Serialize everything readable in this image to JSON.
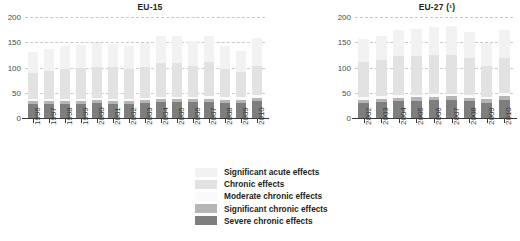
{
  "chart_data": [
    {
      "type": "bar",
      "title": "EU-15",
      "xlabel": "",
      "ylabel": "",
      "ylim": [
        0,
        200
      ],
      "yticks": [
        0,
        50,
        100,
        150,
        200
      ],
      "grid": true,
      "stacked": true,
      "legend_position": "bottom-center",
      "categories": [
        "1996",
        "1997",
        "1998",
        "1999",
        "2000",
        "2001",
        "2002",
        "2003",
        "2004",
        "2005",
        "2006",
        "2007",
        "2008",
        "2009",
        "2010"
      ],
      "series": [
        {
          "name": "Severe chronic effects",
          "values": [
            27,
            27,
            27,
            28,
            29,
            28,
            28,
            30,
            31,
            31,
            31,
            32,
            30,
            30,
            33
          ]
        },
        {
          "name": "Significant chronic effects",
          "values": [
            6,
            6,
            7,
            6,
            6,
            6,
            6,
            6,
            6,
            6,
            6,
            6,
            6,
            6,
            7
          ]
        },
        {
          "name": "Moderate chronic effects",
          "values": [
            4,
            4,
            4,
            4,
            4,
            4,
            4,
            4,
            5,
            5,
            5,
            5,
            5,
            5,
            5
          ]
        },
        {
          "name": "Chronic effects",
          "values": [
            53,
            57,
            60,
            62,
            63,
            63,
            60,
            62,
            67,
            67,
            62,
            67,
            56,
            50,
            59
          ]
        },
        {
          "name": "Significant acute effects",
          "values": [
            40,
            42,
            44,
            45,
            46,
            46,
            44,
            46,
            53,
            54,
            48,
            53,
            45,
            41,
            54
          ]
        }
      ]
    },
    {
      "type": "bar",
      "title": "EU-27 (¹)",
      "xlabel": "",
      "ylabel": "",
      "ylim": [
        0,
        200
      ],
      "yticks": [
        0,
        50,
        100,
        150,
        200
      ],
      "grid": true,
      "stacked": true,
      "legend_position": "bottom-center",
      "categories": [
        "2002",
        "2003",
        "2004",
        "2005",
        "2006",
        "2007",
        "2008",
        "2009",
        "2010"
      ],
      "series": [
        {
          "name": "Severe chronic effects",
          "values": [
            29,
            31,
            33,
            34,
            35,
            36,
            33,
            30,
            36
          ]
        },
        {
          "name": "Significant chronic effects",
          "values": [
            7,
            7,
            7,
            7,
            7,
            7,
            7,
            7,
            8
          ]
        },
        {
          "name": "Moderate chronic effects",
          "values": [
            5,
            5,
            5,
            5,
            5,
            5,
            5,
            5,
            6
          ]
        },
        {
          "name": "Chronic effects",
          "values": [
            69,
            71,
            77,
            76,
            77,
            76,
            73,
            61,
            68
          ]
        },
        {
          "name": "Significant acute effects",
          "values": [
            46,
            48,
            53,
            55,
            56,
            58,
            53,
            46,
            56
          ]
        }
      ]
    }
  ],
  "legend": {
    "items": [
      {
        "label": "Significant acute effects",
        "color": "#f2f2f2"
      },
      {
        "label": "Chronic effects",
        "color": "#e2e2e2"
      },
      {
        "label": "Moderate chronic effects",
        "color": "#fafafa"
      },
      {
        "label": "Significant chronic effects",
        "color": "#b5b5b5"
      },
      {
        "label": "Severe chronic effects",
        "color": "#7e7e7e"
      }
    ]
  },
  "colors": {
    "significant_acute": "#f2f2f2",
    "chronic": "#e2e2e2",
    "moderate_chronic": "#fafafa",
    "significant_chronic": "#b5b5b5",
    "severe_chronic": "#7e7e7e",
    "gridline": "#c9c9c9",
    "axis": "#3a3a3a",
    "text": "#231f20"
  }
}
